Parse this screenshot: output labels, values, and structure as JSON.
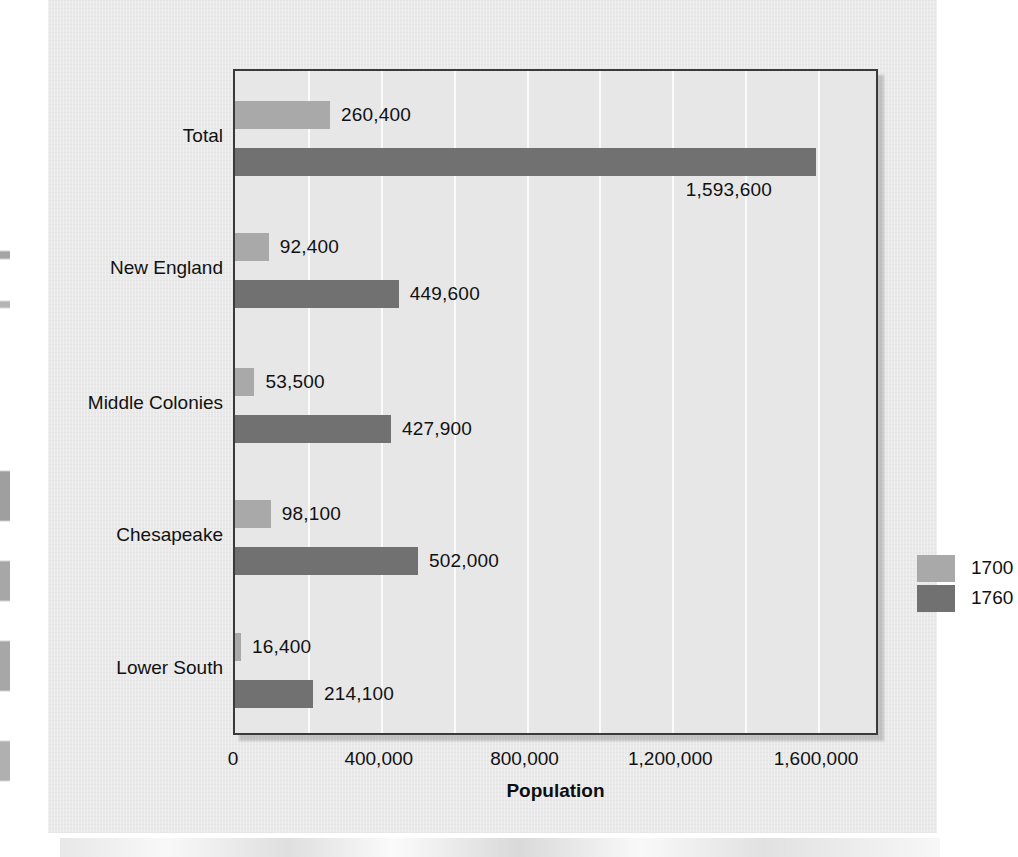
{
  "chart_data": {
    "type": "bar",
    "orientation": "horizontal",
    "title": "",
    "xlabel": "Population",
    "ylabel": "",
    "xlim": [
      0,
      1772000
    ],
    "xticks": [
      0,
      400000,
      800000,
      1200000,
      1600000
    ],
    "xtick_labels": [
      "0",
      "400,000",
      "800,000",
      "1,200,000",
      "1,600,000"
    ],
    "gridlines": [
      200000,
      400000,
      600000,
      800000,
      1000000,
      1200000,
      1400000,
      1600000
    ],
    "grid": true,
    "legend_position": "center-right",
    "categories": [
      "Total",
      "New England",
      "Middle Colonies",
      "Chesapeake",
      "Lower South"
    ],
    "series": [
      {
        "name": "1700",
        "color": "#a9a9a9",
        "values": [
          260400,
          92400,
          53500,
          98100,
          16400
        ],
        "labels": [
          "260,400",
          "92,400",
          "53,500",
          "98,100",
          "16,400"
        ]
      },
      {
        "name": "1760",
        "color": "#717171",
        "values": [
          1593600,
          449600,
          427900,
          502000,
          214100
        ],
        "labels": [
          "1,593,600",
          "449,600",
          "427,900",
          "502,000",
          "214,100"
        ]
      }
    ]
  },
  "legend": {
    "entries": [
      {
        "label": "1700",
        "color": "#a9a9a9"
      },
      {
        "label": "1760",
        "color": "#717171"
      }
    ]
  },
  "axis": {
    "x_title": "Population"
  }
}
